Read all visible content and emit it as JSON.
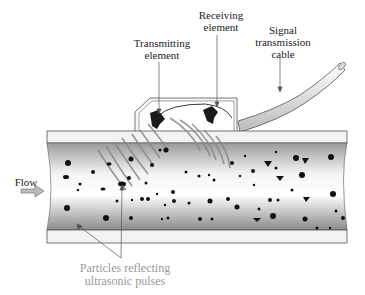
{
  "diagram": {
    "labels": {
      "receiving_element": [
        "Receiving",
        "element"
      ],
      "transmitting_element": [
        "Transmitting",
        "element"
      ],
      "signal_cable": [
        "Signal",
        "transmission",
        "cable"
      ],
      "flow": "Flow",
      "particles": [
        "Particles reflecting",
        "ultrasonic pulses"
      ]
    },
    "colors": {
      "pipe_wall": "#f2f2f2",
      "pipe_outline": "#555555",
      "fluid_dark": "#9a9a9a",
      "fluid_light": "#ffffff",
      "waves": "#888888",
      "particles": "#111111",
      "gray_label": "#999999"
    }
  }
}
